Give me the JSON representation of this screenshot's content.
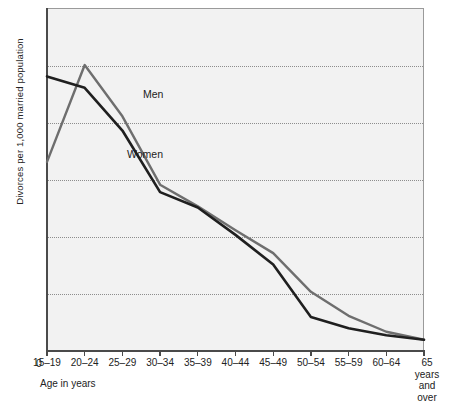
{
  "chart_data": {
    "type": "line",
    "title": "",
    "xlabel": "Age in years",
    "ylabel": "Divorces per 1,000 married population",
    "categories": [
      "15-19",
      "20-24",
      "25-29",
      "30-34",
      "35-39",
      "40-44",
      "45-49",
      "50-54",
      "55-59",
      "60-64",
      "65 years and over"
    ],
    "xtick_labels": [
      "15–19",
      "20–24",
      "25–29",
      "30–34",
      "35–39",
      "40–44",
      "45–49",
      "50–54",
      "55–59",
      "60–64",
      "65 years and over"
    ],
    "last_tick_lines": [
      "65",
      "years",
      "and",
      "over"
    ],
    "ylim": [
      0,
      60
    ],
    "yticks": [
      0,
      10,
      20,
      30,
      40,
      50,
      60
    ],
    "ytick_labels": [
      "0",
      "10",
      "20",
      "30",
      "40",
      "50",
      "60"
    ],
    "grid": "horizontal-dotted",
    "legend": "inline-labels",
    "origin_label": "0",
    "series": [
      {
        "name": "Men",
        "color": "#6e6e6e",
        "label_x": 143,
        "label_y": 88,
        "values": [
          33.0,
          50.0,
          41.0,
          29.0,
          25.2,
          21.0,
          17.0,
          10.2,
          6.0,
          3.2,
          1.8
        ]
      },
      {
        "name": "Women",
        "color": "#1f1f1f",
        "label_x": 127,
        "label_y": 148,
        "values": [
          48.0,
          46.0,
          38.5,
          27.7,
          25.0,
          20.2,
          15.0,
          5.8,
          3.8,
          2.6,
          1.8
        ]
      }
    ]
  }
}
